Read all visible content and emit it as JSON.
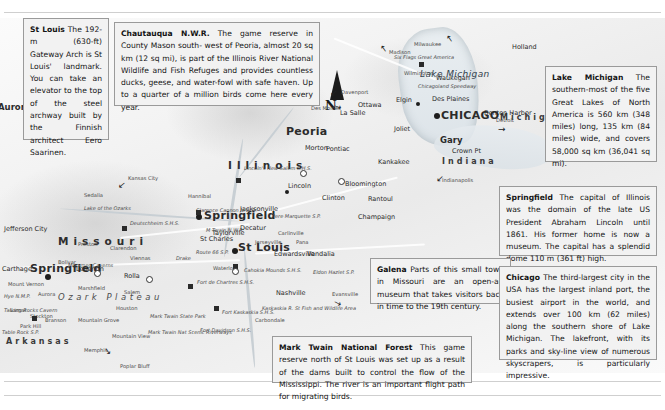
{
  "page": {
    "type": "atlas-map-page",
    "region": "Illinois and Missouri, USA"
  },
  "callouts": [
    {
      "id": "st-louis",
      "title": "St Louis",
      "body": "The 192-m (630-ft) Gateway Arch is St Louis' landmark. You can take an elevator to the top of the steel archway built by the Finnish architect Eero Saarinen."
    },
    {
      "id": "chautauqua",
      "title": "Chautauqua N.W.R.",
      "body": "The game reserve in County Mason south- west of Peoria, almost 20 sq km (12 sq mi), is part of the Illinois River National Wildlife and Fish Refuges and provides countless ducks, geese, and water-fowl with safe haven. Up to a quarter of a million birds come here every year."
    },
    {
      "id": "lake-michigan",
      "title": "Lake Michigan",
      "body": "The southern-most of the five Great Lakes of North America is 560 km (348 miles) long, 135 km (84 miles) wide, and covers 58,000 sq km (36,041 sq mi)."
    },
    {
      "id": "springfield",
      "title": "Springfield",
      "body": "The capital of Illinois was the domain of the late US President Abraham Lincoln until 1861. His former home is now a museum. The capital has a splendid dome 110 m (361 ft) high."
    },
    {
      "id": "galena",
      "title": "Galena",
      "body": "Parts of this small town in Missouri are an open-air museum that takes visitors back in time to the 19th century."
    },
    {
      "id": "chicago",
      "title": "Chicago",
      "body": "The third-largest city in the USA has the largest inland port, the busiest airport in the world, and extends over 100 km (62 miles) along the southern shore of Lake Michigan. The lakefront, with its parks and sky-line view of numerous skyscrapers, is particularly impressive."
    },
    {
      "id": "mark-twain",
      "title": "Mark Twain National Forest",
      "body": "This game reserve north of St Louis was set up as a result of the dams built to control the flow of the Mississippi. The river is an important flight path for migrating birds."
    }
  ],
  "map": {
    "compass_label": "N",
    "waters": [
      {
        "label": "Lake Michigan"
      },
      {
        "label": "Lake of the Ozarks"
      }
    ],
    "states": [
      {
        "label": "Missouri"
      },
      {
        "label": "Illinois"
      },
      {
        "label": "Indiana"
      },
      {
        "label": "Michigan"
      },
      {
        "label": "Arkansas"
      }
    ],
    "regions": [
      {
        "label": "Ozark Plateau"
      }
    ],
    "cities_major": [
      {
        "label": "CHICAGO"
      },
      {
        "label": "Peoria"
      },
      {
        "label": "Springfield"
      },
      {
        "label": "St Louis"
      },
      {
        "label": "Springfield"
      },
      {
        "label": "Aurora"
      },
      {
        "label": "Gary"
      }
    ],
    "cities_medium": [
      {
        "label": "Des Plaines"
      },
      {
        "label": "Waukegan"
      },
      {
        "label": "Elgin"
      },
      {
        "label": "Joliet"
      },
      {
        "label": "La Salle"
      },
      {
        "label": "Ottawa"
      },
      {
        "label": "Pontiac"
      },
      {
        "label": "Kankakee"
      },
      {
        "label": "Bloomington"
      },
      {
        "label": "Clinton"
      },
      {
        "label": "Lincoln"
      },
      {
        "label": "Morton"
      },
      {
        "label": "Decatur"
      },
      {
        "label": "Champaign"
      },
      {
        "label": "Rantoul"
      },
      {
        "label": "Taylorville"
      },
      {
        "label": "Jacksonville"
      },
      {
        "label": "St Charles"
      },
      {
        "label": "Edwardsville"
      },
      {
        "label": "Vandalia"
      },
      {
        "label": "Nashville"
      },
      {
        "label": "Jefferson City"
      },
      {
        "label": "Rolla"
      },
      {
        "label": "Lebanon"
      },
      {
        "label": "Carthage"
      },
      {
        "label": "Bolivar"
      },
      {
        "label": "Marshfield"
      },
      {
        "label": "Houston"
      },
      {
        "label": "Branson"
      },
      {
        "label": "Holland"
      },
      {
        "label": "Benton Harbor"
      },
      {
        "label": "Crown Pt"
      },
      {
        "label": "Waterloo"
      },
      {
        "label": "Hannibal"
      },
      {
        "label": "Jerseyville"
      },
      {
        "label": "Carlinville"
      },
      {
        "label": "Pana"
      },
      {
        "label": "Sedalia"
      },
      {
        "label": "Clarendon"
      },
      {
        "label": "Salem"
      },
      {
        "label": "Mount Vernon"
      },
      {
        "label": "Aurora"
      },
      {
        "label": "Lamar"
      },
      {
        "label": "Stockton"
      },
      {
        "label": "Preston"
      },
      {
        "label": "Viennas"
      },
      {
        "label": "Mountain Grove"
      },
      {
        "label": "Mountain View"
      },
      {
        "label": "Carbondale"
      },
      {
        "label": "Wilmington"
      },
      {
        "label": "Park Hill"
      }
    ],
    "pointer_labels": [
      {
        "label": "Milwaukee"
      },
      {
        "label": "Madison"
      },
      {
        "label": "Davenport"
      },
      {
        "label": "Des Moines"
      },
      {
        "label": "Kansas City"
      },
      {
        "label": "Detroit"
      },
      {
        "label": "Indianapolis"
      },
      {
        "label": "Evansville"
      },
      {
        "label": "Memphis"
      },
      {
        "label": "Poplar Bluff"
      }
    ],
    "parks": [
      {
        "label": "Chautauqua N.W.R."
      },
      {
        "label": "Lincoln's New Salem S.H.S."
      },
      {
        "label": "Clarence Cannon N.W.R."
      },
      {
        "label": "M Twain N.W.R."
      },
      {
        "label": "Pere Marquette S.P."
      },
      {
        "label": "Cahokia Mounds S.H.S."
      },
      {
        "label": "Fort de Chartres S.H.S."
      },
      {
        "label": "Fort Kaskaskia S.H.S."
      },
      {
        "label": "Fort Davidson S.H.S."
      },
      {
        "label": "Kaskaskia R. St Fish and Wildlife Area"
      },
      {
        "label": "Eldon Hazlet S.P."
      },
      {
        "label": "Meramec Caverns"
      },
      {
        "label": "Talking Rocks Cavern"
      },
      {
        "label": "Table Rock S.P."
      },
      {
        "label": "Mark Twain Nat Scenic Riverways"
      },
      {
        "label": "Mark Twain State Park"
      },
      {
        "label": "Hye N.M.P."
      },
      {
        "label": "Deutschheim S.H.S."
      },
      {
        "label": "Six Flags Great America"
      },
      {
        "label": "Chicagoland Speedway"
      },
      {
        "label": "Route 66 S.P."
      },
      {
        "label": "Drake"
      }
    ]
  }
}
